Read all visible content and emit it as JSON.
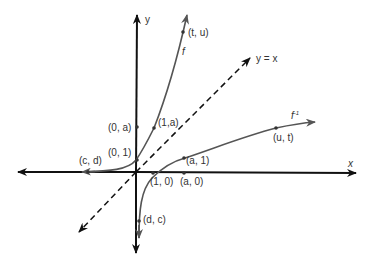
{
  "diagram": {
    "axes": {
      "x_label": "x",
      "y_label": "y"
    },
    "line_label": "y = x",
    "curve_labels": {
      "f": "f",
      "f_inverse": "f",
      "f_inverse_sup": "-1"
    },
    "points": [
      {
        "id": "t-u",
        "label": "(t, u)"
      },
      {
        "id": "0-a",
        "label": "(0, a)"
      },
      {
        "id": "1-a",
        "label": "(1,a)"
      },
      {
        "id": "0-1",
        "label": "(0, 1)"
      },
      {
        "id": "c-d",
        "label": "(c, d)"
      },
      {
        "id": "1-0",
        "label": "(1, 0)"
      },
      {
        "id": "a-0",
        "label": "(a, 0)"
      },
      {
        "id": "a-1",
        "label": "(a, 1)"
      },
      {
        "id": "u-t",
        "label": "(u, t)"
      },
      {
        "id": "d-c",
        "label": "(d, c)"
      }
    ],
    "colors": {
      "axis": "#111111",
      "curve": "#555555",
      "text": "#333333"
    }
  }
}
